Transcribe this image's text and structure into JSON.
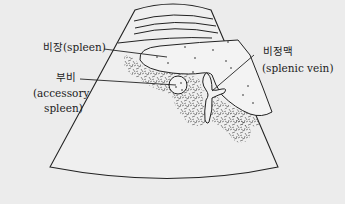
{
  "diagram": {
    "type": "ultrasound-schematic",
    "colors": {
      "background": "#ececec",
      "line": "#222222",
      "texture": "#444444"
    },
    "labels": {
      "spleen": "비장(spleen)",
      "accessory_ko": "부비",
      "accessory_en_1": "(accessory",
      "accessory_en_2": "spleen)",
      "vein_ko": "비정맥",
      "vein_en": "(splenic vein)"
    }
  }
}
